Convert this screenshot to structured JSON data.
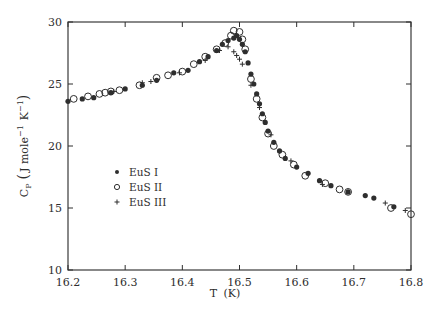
{
  "chart_data": {
    "type": "scatter",
    "title": "",
    "xlabel": "T (K)",
    "ylabel": "C_P (J mole^-1 K^-1)",
    "ylabel_parts": {
      "base": "C",
      "sub": "P",
      "units_open": "(",
      "units": "J mole",
      "exp1": "−1",
      "k": "K",
      "exp2": "−1",
      "units_close": ")"
    },
    "xlabel_parts": {
      "base": "T",
      "unit": "(K)"
    },
    "xlim": [
      16.2,
      16.8
    ],
    "ylim": [
      10,
      30
    ],
    "xticks": [
      16.2,
      16.3,
      16.4,
      16.5,
      16.6,
      16.7,
      16.8
    ],
    "xtick_labels": [
      "16.2",
      "16.3",
      "16.4",
      "16.5",
      "16.6",
      "16.7",
      "16.8"
    ],
    "yticks": [
      10,
      15,
      20,
      25,
      30
    ],
    "ytick_labels": [
      "10",
      "15",
      "20",
      "25",
      "30"
    ],
    "grid": false,
    "legend_position": "center-left inside plot",
    "series": [
      {
        "name": "EuS I",
        "marker": "filled-circle",
        "points": [
          [
            16.2,
            23.6
          ],
          [
            16.225,
            23.8
          ],
          [
            16.245,
            23.9
          ],
          [
            16.275,
            24.3
          ],
          [
            16.3,
            24.6
          ],
          [
            16.33,
            24.9
          ],
          [
            16.355,
            25.3
          ],
          [
            16.385,
            25.9
          ],
          [
            16.41,
            26.1
          ],
          [
            16.43,
            26.8
          ],
          [
            16.445,
            27.2
          ],
          [
            16.46,
            27.7
          ],
          [
            16.47,
            28.2
          ],
          [
            16.48,
            28.5
          ],
          [
            16.49,
            28.7
          ],
          [
            16.495,
            28.9
          ],
          [
            16.5,
            28.6
          ],
          [
            16.505,
            28.2
          ],
          [
            16.51,
            27.6
          ],
          [
            16.515,
            26.7
          ],
          [
            16.52,
            25.8
          ],
          [
            16.525,
            25.0
          ],
          [
            16.53,
            24.2
          ],
          [
            16.535,
            23.4
          ],
          [
            16.54,
            22.6
          ],
          [
            16.545,
            21.9
          ],
          [
            16.55,
            21.2
          ],
          [
            16.56,
            20.3
          ],
          [
            16.57,
            19.6
          ],
          [
            16.58,
            19.0
          ],
          [
            16.6,
            18.3
          ],
          [
            16.62,
            17.8
          ],
          [
            16.64,
            17.2
          ],
          [
            16.66,
            16.8
          ],
          [
            16.69,
            16.3
          ],
          [
            16.72,
            16.0
          ],
          [
            16.735,
            15.8
          ],
          [
            16.77,
            15.1
          ]
        ]
      },
      {
        "name": "EuS II",
        "marker": "open-circle",
        "points": [
          [
            16.21,
            23.8
          ],
          [
            16.235,
            24.0
          ],
          [
            16.255,
            24.2
          ],
          [
            16.265,
            24.3
          ],
          [
            16.275,
            24.4
          ],
          [
            16.29,
            24.5
          ],
          [
            16.325,
            24.9
          ],
          [
            16.355,
            25.5
          ],
          [
            16.375,
            25.7
          ],
          [
            16.4,
            26.0
          ],
          [
            16.42,
            26.6
          ],
          [
            16.44,
            27.2
          ],
          [
            16.46,
            27.8
          ],
          [
            16.475,
            28.3
          ],
          [
            16.485,
            28.9
          ],
          [
            16.49,
            29.3
          ],
          [
            16.5,
            29.2
          ],
          [
            16.505,
            28.6
          ],
          [
            16.51,
            27.8
          ],
          [
            16.52,
            25.4
          ],
          [
            16.53,
            23.8
          ],
          [
            16.54,
            22.3
          ],
          [
            16.55,
            21.0
          ],
          [
            16.56,
            20.0
          ],
          [
            16.575,
            19.3
          ],
          [
            16.595,
            18.5
          ],
          [
            16.615,
            17.6
          ],
          [
            16.65,
            17.0
          ],
          [
            16.675,
            16.5
          ],
          [
            16.69,
            16.3
          ],
          [
            16.765,
            15.0
          ],
          [
            16.8,
            14.5
          ]
        ]
      },
      {
        "name": "EuS III",
        "marker": "plus",
        "points": [
          [
            16.28,
            24.4
          ],
          [
            16.33,
            25.1
          ],
          [
            16.345,
            25.2
          ],
          [
            16.395,
            25.9
          ],
          [
            16.44,
            26.9
          ],
          [
            16.465,
            27.7
          ],
          [
            16.48,
            28.0
          ],
          [
            16.49,
            27.6
          ],
          [
            16.495,
            27.3
          ],
          [
            16.5,
            27.0
          ],
          [
            16.505,
            26.6
          ],
          [
            16.52,
            24.9
          ],
          [
            16.535,
            23.1
          ],
          [
            16.555,
            20.9
          ],
          [
            16.59,
            18.8
          ],
          [
            16.645,
            16.9
          ],
          [
            16.755,
            15.4
          ],
          [
            16.79,
            14.8
          ]
        ]
      }
    ]
  },
  "legend": {
    "items": [
      {
        "label": "EuS I",
        "marker": "filled-circle"
      },
      {
        "label": "EuS II",
        "marker": "open-circle"
      },
      {
        "label": "EuS III",
        "marker": "plus"
      }
    ]
  },
  "colors": {
    "ink": "#2e2e2e",
    "background": "#ffffff"
  }
}
